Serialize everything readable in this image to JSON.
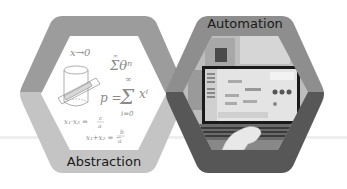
{
  "diagram": {
    "nodes": [
      {
        "id": "abstraction",
        "label": "Abstraction",
        "shape": "hexagon",
        "border_top_color": "#9c9c9c",
        "border_bottom_color": "#c4c4c4",
        "content": "math-formulas",
        "formulas": {
          "limit": "x→0",
          "series_top": "∞",
          "series_sum": "Σθⁿ",
          "p_eq": "p =",
          "sum_sym": "Σ",
          "sum_top": "∞",
          "sum_bottom": "i=0",
          "sum_term": "xⁱ",
          "vieta1_lhs": "x₁·x₂ =",
          "vieta1_num": "c",
          "vieta1_den": "a",
          "vieta2_lhs": "x₁+x₂ = −",
          "vieta2_num": "b",
          "vieta2_den": "a"
        }
      },
      {
        "id": "automation",
        "label": "Automation",
        "shape": "hexagon",
        "border_top_color": "#8e8e8e",
        "border_bottom_color": "#575757",
        "content": "photo-laptop-hand"
      }
    ],
    "baseline_color": "#ececec"
  }
}
